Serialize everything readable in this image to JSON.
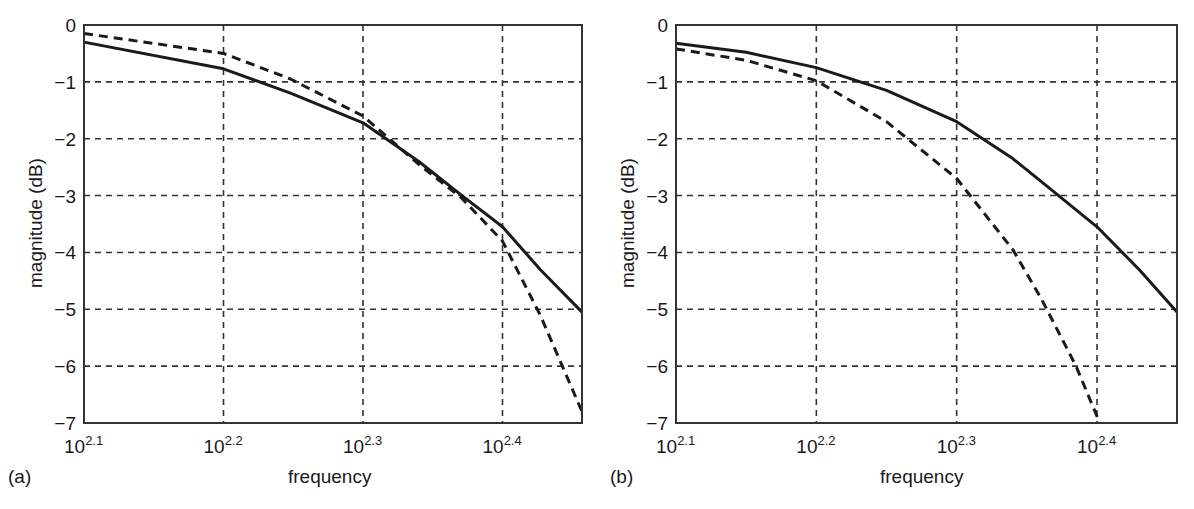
{
  "figure": {
    "panels": [
      {
        "id": "a",
        "label": "(a)",
        "xlabel": "frequency",
        "ylabel": "magnitude (dB)"
      },
      {
        "id": "b",
        "label": "(b)",
        "xlabel": "frequency",
        "ylabel": "magnitude (dB)"
      }
    ],
    "y_ticks": [
      "0",
      "−1",
      "−2",
      "−3",
      "−4",
      "−5",
      "−6",
      "−7"
    ],
    "x_ticks": [
      {
        "base": "10",
        "exp": "2.1"
      },
      {
        "base": "10",
        "exp": "2.2"
      },
      {
        "base": "10",
        "exp": "2.3"
      },
      {
        "base": "10",
        "exp": "2.4"
      }
    ],
    "colors": {
      "curve": "#1a1a1a",
      "grid": "#333333",
      "axes": "#333333",
      "background": "#ffffff"
    }
  },
  "chart_data": [
    {
      "type": "line",
      "panel": "(a)",
      "title": "",
      "xlabel": "frequency",
      "ylabel": "magnitude (dB)",
      "xscale": "log10",
      "xlim_log10": [
        2.1,
        2.457
      ],
      "ylim": [
        -7,
        0
      ],
      "x_tick_labels": [
        "10^2.1",
        "10^2.2",
        "10^2.3",
        "10^2.4"
      ],
      "y_tick_labels": [
        0,
        -1,
        -2,
        -3,
        -4,
        -5,
        -6,
        -7
      ],
      "grid": true,
      "grid_style": "dashed",
      "legend": null,
      "series": [
        {
          "name": "solid",
          "style": "solid",
          "x_log10": [
            2.1,
            2.2,
            2.248,
            2.3,
            2.34,
            2.371,
            2.4,
            2.427,
            2.457
          ],
          "values": [
            -0.3,
            -0.77,
            -1.2,
            -1.72,
            -2.4,
            -3.0,
            -3.55,
            -4.3,
            -5.05
          ]
        },
        {
          "name": "dashed",
          "style": "dashed",
          "x_log10": [
            2.1,
            2.2,
            2.248,
            2.3,
            2.34,
            2.371,
            2.4,
            2.427,
            2.457
          ],
          "values": [
            -0.15,
            -0.5,
            -0.95,
            -1.6,
            -2.45,
            -3.05,
            -3.8,
            -5.1,
            -6.8
          ]
        }
      ]
    },
    {
      "type": "line",
      "panel": "(b)",
      "title": "",
      "xlabel": "frequency",
      "ylabel": "magnitude (dB)",
      "xscale": "log10",
      "xlim_log10": [
        2.1,
        2.457
      ],
      "ylim": [
        -7,
        0
      ],
      "x_tick_labels": [
        "10^2.1",
        "10^2.2",
        "10^2.3",
        "10^2.4"
      ],
      "y_tick_labels": [
        0,
        -1,
        -2,
        -3,
        -4,
        -5,
        -6,
        -7
      ],
      "grid": true,
      "grid_style": "dashed",
      "legend": null,
      "series": [
        {
          "name": "solid",
          "style": "solid",
          "x_log10": [
            2.1,
            2.15,
            2.2,
            2.25,
            2.3,
            2.34,
            2.37,
            2.4,
            2.43,
            2.457
          ],
          "values": [
            -0.32,
            -0.48,
            -0.75,
            -1.15,
            -1.7,
            -2.35,
            -2.95,
            -3.55,
            -4.3,
            -5.05
          ]
        },
        {
          "name": "dashed",
          "style": "dashed",
          "x_log10": [
            2.1,
            2.15,
            2.2,
            2.25,
            2.3,
            2.34,
            2.36,
            2.385,
            2.402
          ],
          "values": [
            -0.42,
            -0.62,
            -0.98,
            -1.7,
            -2.7,
            -3.95,
            -4.8,
            -6.0,
            -7.0
          ]
        }
      ]
    }
  ]
}
